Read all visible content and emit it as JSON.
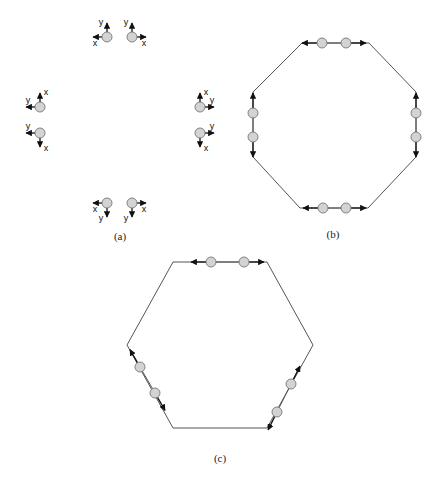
{
  "figure": {
    "panels": [
      {
        "id": "a",
        "caption": "(a)",
        "description": "Eight isolated nodes with local x/y coordinate axes",
        "axis_labels": {
          "x": "x",
          "y": "y"
        },
        "nodes": [
          {
            "pos": [
              107,
              37
            ],
            "x_dir": "left",
            "y_dir": "up"
          },
          {
            "pos": [
              132,
              37
            ],
            "x_dir": "right",
            "y_dir": "up"
          },
          {
            "pos": [
              40,
              107
            ],
            "x_dir": "up",
            "y_dir": "left"
          },
          {
            "pos": [
              40,
              133
            ],
            "x_dir": "down",
            "y_dir": "left"
          },
          {
            "pos": [
              200,
              107
            ],
            "x_dir": "up",
            "y_dir": "right"
          },
          {
            "pos": [
              200,
              133
            ],
            "x_dir": "down",
            "y_dir": "right"
          },
          {
            "pos": [
              107,
              203
            ],
            "x_dir": "left",
            "y_dir": "down"
          },
          {
            "pos": [
              132,
              203
            ],
            "x_dir": "right",
            "y_dir": "down"
          }
        ]
      },
      {
        "id": "b",
        "caption": "(b)",
        "description": "Octagon formed by connecting node pairs",
        "vertices": [
          [
            302,
            43
          ],
          [
            369,
            43
          ],
          [
            416,
            92
          ],
          [
            416,
            157
          ],
          [
            368,
            208
          ],
          [
            300,
            208
          ],
          [
            253,
            157
          ],
          [
            253,
            92
          ]
        ],
        "nodes": [
          [
            322,
            43
          ],
          [
            346,
            43
          ],
          [
            416,
            113
          ],
          [
            416,
            137
          ],
          [
            346,
            208
          ],
          [
            323,
            208
          ],
          [
            253,
            137
          ],
          [
            253,
            113
          ]
        ]
      },
      {
        "id": "c",
        "caption": "(c)",
        "description": "Hexagon formed by connecting node pairs",
        "vertices": [
          [
            173,
            262
          ],
          [
            267,
            262
          ],
          [
            313,
            345
          ],
          [
            267,
            428
          ],
          [
            173,
            428
          ],
          [
            127,
            345
          ]
        ],
        "nodes": [
          [
            211,
            262
          ],
          [
            244,
            262
          ],
          [
            291,
            384
          ],
          [
            277,
            412
          ],
          [
            155,
            393
          ],
          [
            140,
            367
          ]
        ]
      }
    ]
  }
}
